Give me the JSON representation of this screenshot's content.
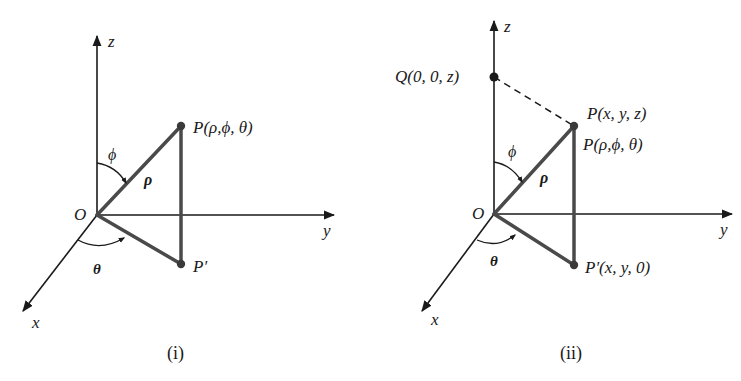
{
  "colors": {
    "axis": "#1a1a1a",
    "triangle": "#4a4a4a",
    "text": "#1a1a1a",
    "background": "#ffffff"
  },
  "panel_i": {
    "caption": "(i)",
    "axis_labels": {
      "z": "z",
      "y": "y",
      "x": "x"
    },
    "origin_label": "O",
    "angle_phi": "ϕ",
    "angle_theta": "θ",
    "rho_label": "ρ",
    "point_P": "P(ρ,ϕ, θ)",
    "point_P_prime": "P′"
  },
  "panel_ii": {
    "caption": "(ii)",
    "axis_labels": {
      "z": "z",
      "y": "y",
      "x": "x"
    },
    "origin_label": "O",
    "angle_phi": "ϕ",
    "angle_theta": "θ",
    "rho_label": "ρ",
    "point_Q": "Q(0, 0, z)",
    "point_P_cartesian": "P(x, y, z)",
    "point_P_spherical": "P(ρ,ϕ, θ)",
    "point_P_prime": "P′(x, y, 0)"
  }
}
